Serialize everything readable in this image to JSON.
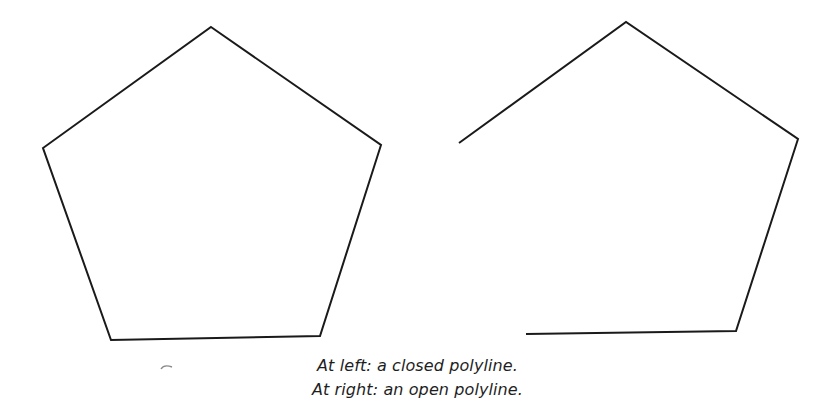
{
  "figure": {
    "stroke_color": "#1a1a1a",
    "stroke_width": 2,
    "closed_polyline": {
      "label": "closed polyline",
      "points": "211,27 381,145 320,336 111,340 43,148"
    },
    "open_polyline": {
      "label": "open polyline",
      "points": "459,143 626,22 798,139 736,331 526,334"
    }
  },
  "captions": {
    "line1": {
      "lead": "At left:",
      "text": " a closed polyline."
    },
    "line2": {
      "lead": "At right:",
      "text": " an open polyline."
    }
  }
}
